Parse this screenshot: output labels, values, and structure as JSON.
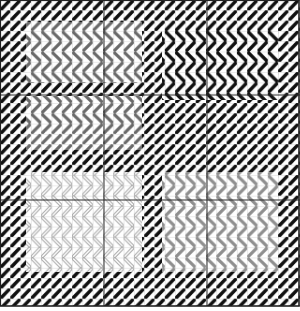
{
  "chart": {
    "title": "Needlepoint stitch chart",
    "width": 300,
    "height": 311,
    "grid": {
      "cell": 10.3,
      "minor_color": "#b8b8b8",
      "major_color": "#2a2a2a",
      "major_x": [
        0,
        104,
        207,
        299
      ],
      "major_y": [
        0,
        95,
        200,
        306
      ]
    },
    "colors": {
      "black": "#111111",
      "dark_gray": "#6a6a6a",
      "mid_gray": "#8f8f8f",
      "light_gray_outline": "#a8a8a8",
      "background": "#ffffff"
    },
    "regions": [
      {
        "name": "top-border",
        "x": 0,
        "y": 0,
        "w": 300,
        "h": 22,
        "stitch": "diagonal",
        "color": "black"
      },
      {
        "name": "bottom-border",
        "x": 0,
        "y": 272,
        "w": 300,
        "h": 34,
        "stitch": "diagonal",
        "color": "black"
      },
      {
        "name": "left-border",
        "x": 0,
        "y": 0,
        "w": 26,
        "h": 306,
        "stitch": "diagonal",
        "color": "black"
      },
      {
        "name": "right-border",
        "x": 278,
        "y": 0,
        "w": 22,
        "h": 306,
        "stitch": "diagonal",
        "color": "black"
      },
      {
        "name": "center-divider",
        "x": 142,
        "y": 0,
        "w": 20,
        "h": 306,
        "stitch": "diagonal",
        "color": "black"
      },
      {
        "name": "left-top-chevrons",
        "x": 26,
        "y": 22,
        "w": 116,
        "h": 60,
        "stitch": "chevron",
        "color": "dark_gray"
      },
      {
        "name": "left-black-band",
        "x": 26,
        "y": 82,
        "w": 116,
        "h": 14,
        "stitch": "diagonal",
        "color": "black"
      },
      {
        "name": "left-mid-chevrons",
        "x": 26,
        "y": 96,
        "w": 116,
        "h": 36,
        "stitch": "chevron",
        "color": "dark_gray"
      },
      {
        "name": "left-mid-diagonal",
        "x": 26,
        "y": 132,
        "w": 116,
        "h": 18,
        "stitch": "diagonal",
        "color": "dark_gray"
      },
      {
        "name": "left-black-diagonal",
        "x": 26,
        "y": 150,
        "w": 116,
        "h": 22,
        "stitch": "diagonal",
        "color": "black"
      },
      {
        "name": "left-bottom-chevrons",
        "x": 26,
        "y": 172,
        "w": 116,
        "h": 100,
        "stitch": "chevron-outline",
        "color": "light_gray_outline"
      },
      {
        "name": "right-top-chevrons",
        "x": 162,
        "y": 22,
        "w": 116,
        "h": 78,
        "stitch": "chevron",
        "color": "black"
      },
      {
        "name": "right-black-diagonal",
        "x": 162,
        "y": 100,
        "w": 116,
        "h": 72,
        "stitch": "diagonal",
        "color": "black"
      },
      {
        "name": "right-bottom-chevrons",
        "x": 162,
        "y": 172,
        "w": 116,
        "h": 100,
        "stitch": "chevron",
        "color": "mid_gray"
      }
    ]
  }
}
